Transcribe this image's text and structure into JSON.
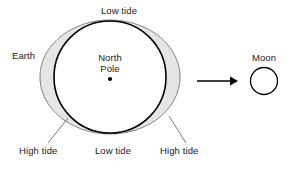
{
  "diagram": {
    "colors": {
      "stroke": "#000000",
      "bulge_fill": "#e2e2e2",
      "bulge_stroke": "#4d4d4d",
      "text": "#1a1a1a",
      "background": "#ffffff"
    },
    "labels": {
      "low_tide_top": "Low tide",
      "earth": "Earth",
      "north_pole_line1": "North",
      "north_pole_line2": "Pole",
      "moon": "Moon",
      "high_tide_left": "High tide",
      "low_tide_bottom": "Low tide",
      "high_tide_right": "High tide"
    },
    "geometry": {
      "earth_center_x": 110,
      "earth_center_y": 77,
      "earth_radius": 56,
      "bulge_rx": 70,
      "bulge_ry": 57,
      "pole_dot_x": 110,
      "pole_dot_y": 79,
      "pole_dot_r": 2.1,
      "moon_center_x": 264,
      "moon_center_y": 81,
      "moon_radius": 13.5,
      "arrow_start_x": 197,
      "arrow_end_x": 236,
      "arrow_y": 81
    }
  }
}
